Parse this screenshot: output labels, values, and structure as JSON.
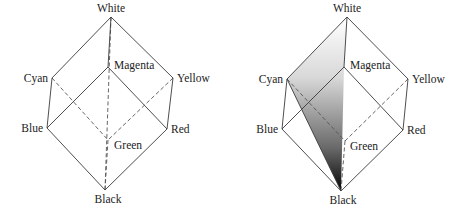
{
  "figure": {
    "left_cube": {
      "labels": {
        "white": "White",
        "magenta": "Magenta",
        "cyan": "Cyan",
        "yellow": "Yellow",
        "blue": "Blue",
        "red": "Red",
        "green": "Green",
        "black": "Black"
      }
    },
    "right_cube": {
      "labels": {
        "white": "White",
        "magenta": "Magenta",
        "cyan": "Cyan",
        "yellow": "Yellow",
        "blue": "Blue",
        "red": "Red",
        "green": "Green",
        "black": "Black"
      },
      "shaded_plane": [
        "White",
        "Cyan",
        "Black"
      ],
      "gradient": {
        "top": "#ffffff",
        "bottom": "#000000"
      }
    }
  }
}
